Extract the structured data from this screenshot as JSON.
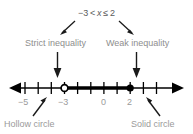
{
  "diagram": {
    "title_expression": "−3 < x ≤ 2",
    "expression_parts": {
      "lower_bound": "−3",
      "lower_operator": "<",
      "variable": "x",
      "upper_operator": "≤",
      "upper_bound": "2"
    },
    "annotations": {
      "left_label": "Strict inequality",
      "right_label": "Weak inequality"
    },
    "captions": {
      "left_caption": "Hollow circle",
      "right_caption": "Solid circle"
    },
    "axis": {
      "tick_labels": [
        {
          "value": -5,
          "text": "−5"
        },
        {
          "value": -3,
          "text": "−3"
        },
        {
          "value": 0,
          "text": "0"
        },
        {
          "value": 2,
          "text": "2"
        }
      ],
      "tick_values": [
        -6,
        -5,
        -4,
        -3,
        -2,
        -1,
        0,
        1,
        2,
        3,
        4
      ],
      "min": -6.8,
      "max": 4.8,
      "arrow_left": true,
      "arrow_right": true
    },
    "endpoints": [
      {
        "name": "open-endpoint",
        "value": -3,
        "style": "hollow",
        "included": false
      },
      {
        "name": "closed-endpoint",
        "value": 2,
        "style": "solid",
        "included": true
      }
    ],
    "shaded_interval": {
      "from": -3,
      "to": 2
    },
    "colors": {
      "line": "#000000",
      "label_gray": "#9a9a9a",
      "expression_gray": "#5b5b5b",
      "background": "#ffffff"
    }
  }
}
